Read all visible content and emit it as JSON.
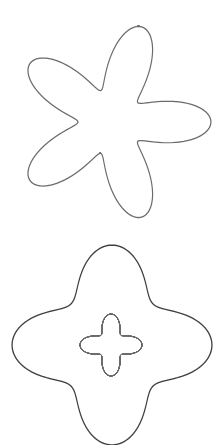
{
  "image": {
    "width": 224,
    "height": 445,
    "background": "#ffffff"
  },
  "figures": [
    {
      "name": "top-spirograph",
      "cx": 111,
      "cy": 122,
      "inner_radius": 33,
      "outer_radius": 100,
      "lobes": 5,
      "loops": 18,
      "stroke": "#3a3a3a",
      "stroke_opacity": 0.75,
      "stroke_width": 1.1
    },
    {
      "name": "bottom-outer-spirograph",
      "cx": 112,
      "cy": 345,
      "inner_radius": 58,
      "outer_radius": 100,
      "lobes": 4,
      "loops": 26,
      "stroke": "#111111",
      "stroke_opacity": 0.8,
      "stroke_width": 1.2
    },
    {
      "name": "bottom-inner-spirograph",
      "cx": 111,
      "cy": 345,
      "inner_radius": 14,
      "outer_radius": 31,
      "lobes": 4,
      "loops": 11,
      "stroke": "#6a6a6a",
      "stroke_opacity": 0.75,
      "stroke_width": 0.9
    }
  ]
}
